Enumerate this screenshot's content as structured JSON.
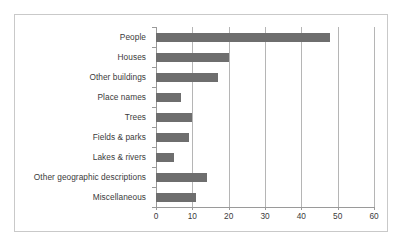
{
  "chart_data": {
    "type": "bar",
    "orientation": "horizontal",
    "title": "",
    "xlabel": "",
    "ylabel": "",
    "xlim": [
      0,
      60
    ],
    "xticks": [
      0,
      10,
      20,
      30,
      40,
      50,
      60
    ],
    "grid": true,
    "legend": false,
    "bar_color": "#6e6e6e",
    "categories": [
      "People",
      "Houses",
      "Other buildings",
      "Place names",
      "Trees",
      "Fields & parks",
      "Lakes & rivers",
      "Other geographic descriptions",
      "Miscellaneous"
    ],
    "values": [
      48,
      20,
      17,
      7,
      10,
      9,
      5,
      14,
      11
    ]
  },
  "colors": {
    "bar": "#6e6e6e",
    "frame_border": "#c9c9c9",
    "gridline": "#b5b5b5",
    "axis": "#9a9a9a",
    "text": "#3b3b3b",
    "background": "#ffffff"
  }
}
